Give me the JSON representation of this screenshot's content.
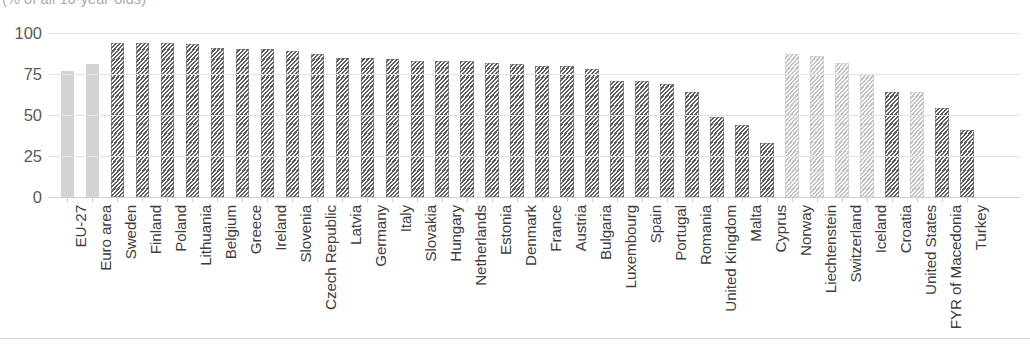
{
  "chart_data": {
    "type": "bar",
    "title": "",
    "subtitle": "(% of all 16-year-olds)",
    "xlabel": "",
    "ylabel": "",
    "ylim": [
      0,
      100
    ],
    "yticks": [
      0,
      25,
      50,
      75,
      100
    ],
    "grid": true,
    "legend": "none",
    "categories": [
      "EU-27",
      "Euro area",
      "Sweden",
      "Finland",
      "Poland",
      "Lithuania",
      "Belgium",
      "Greece",
      "Ireland",
      "Slovenia",
      "Czech Republic",
      "Latvia",
      "Germany",
      "Italy",
      "Slovakia",
      "Hungary",
      "Netherlands",
      "Estonia",
      "Denmark",
      "France",
      "Austria",
      "Bulgaria",
      "Luxembourg",
      "Spain",
      "Portugal",
      "Romania",
      "United Kingdom",
      "Malta",
      "Cyprus",
      "Norway",
      "Liechtenstein",
      "Switzerland",
      "Iceland",
      "Croatia",
      "United States",
      "FYR of Macedonia",
      "Turkey"
    ],
    "values": [
      77,
      81,
      94,
      94,
      94,
      93,
      91,
      90,
      90,
      89,
      87,
      85,
      85,
      84,
      83,
      83,
      83,
      82,
      81,
      80,
      80,
      78,
      71,
      71,
      69,
      64,
      49,
      44,
      33,
      87,
      86,
      82,
      75,
      64,
      64,
      54,
      41
    ],
    "styles": [
      "solid-light",
      "solid-light",
      "hatch-dark",
      "hatch-dark",
      "hatch-dark",
      "hatch-dark",
      "hatch-dark",
      "hatch-dark",
      "hatch-dark",
      "hatch-dark",
      "hatch-dark",
      "hatch-dark",
      "hatch-dark",
      "hatch-dark",
      "hatch-dark",
      "hatch-dark",
      "hatch-dark",
      "hatch-dark",
      "hatch-dark",
      "hatch-dark",
      "hatch-dark",
      "hatch-dark",
      "hatch-dark",
      "hatch-dark",
      "hatch-dark",
      "hatch-dark",
      "hatch-dark",
      "hatch-dark",
      "hatch-dark",
      "hatch-light",
      "hatch-light",
      "hatch-light",
      "hatch-light",
      "hatch-dark",
      "hatch-light",
      "hatch-dark",
      "hatch-dark"
    ],
    "colors": {
      "aggregate_bar": "#d3d3d3",
      "member_state_hatch": "#5e5e5e",
      "non_member_hatch": "#c2c2c2",
      "gridline": "#e3e3e3",
      "axis_text": "#3d3d3d"
    }
  }
}
